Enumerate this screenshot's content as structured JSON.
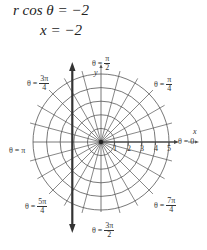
{
  "equations": {
    "line1": "r cos θ = −2",
    "line2": "x = −2"
  },
  "diagram": {
    "type": "polar-grid",
    "max_radius": 5,
    "radial_step_deg": 15,
    "vertical_line_x": -2,
    "axes": {
      "x_label": "x",
      "y_label": "y"
    },
    "ticks": [
      "1",
      "2",
      "3",
      "4",
      "5"
    ],
    "angle_labels": [
      {
        "id": "0",
        "prefix": "θ = ",
        "num": "0",
        "den": ""
      },
      {
        "id": "pi4",
        "prefix": "θ = ",
        "num": "π",
        "den": "4"
      },
      {
        "id": "pi2",
        "prefix": "θ = ",
        "num": "π",
        "den": "2"
      },
      {
        "id": "3pi4",
        "prefix": "θ = ",
        "num": "3π",
        "den": "4"
      },
      {
        "id": "pi",
        "prefix": "θ = ",
        "num": "π",
        "den": ""
      },
      {
        "id": "5pi4",
        "prefix": "θ = ",
        "num": "5π",
        "den": "4"
      },
      {
        "id": "3pi2",
        "prefix": "θ = ",
        "num": "3π",
        "den": "2"
      },
      {
        "id": "7pi4",
        "prefix": "θ = ",
        "num": "7π",
        "den": "4"
      }
    ]
  }
}
